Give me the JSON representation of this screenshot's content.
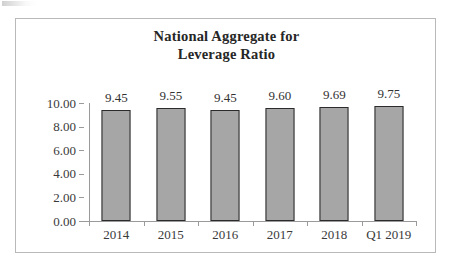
{
  "chart_data": {
    "type": "bar",
    "title": "National Aggregate for Leverage Ratio",
    "title_lines": [
      "National Aggregate for",
      "Leverage Ratio"
    ],
    "categories": [
      "2014",
      "2015",
      "2016",
      "2017",
      "2018",
      "Q1 2019"
    ],
    "values": [
      9.45,
      9.55,
      9.45,
      9.6,
      9.69,
      9.75
    ],
    "value_labels": [
      "9.45",
      "9.55",
      "9.45",
      "9.60",
      "9.69",
      "9.75"
    ],
    "xlabel": "",
    "ylabel": "",
    "ylim": [
      0,
      10
    ],
    "ytick_values": [
      10.0,
      8.0,
      6.0,
      4.0,
      2.0,
      0.0
    ],
    "ytick_labels": [
      "10.00",
      "8.00",
      "6.00",
      "4.00",
      "2.00",
      "0.00"
    ],
    "grid": false,
    "legend": null,
    "colors": {
      "bar_fill": "#a6a6a6",
      "bar_border": "#2b2b2b",
      "axis": "#9a9a9a",
      "text": "#333333",
      "frame_border": "#b9b9b9",
      "background": "#ffffff"
    }
  }
}
